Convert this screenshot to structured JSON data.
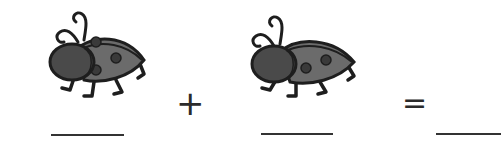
{
  "worksheet": {
    "equation": {
      "term1": {
        "picture": "ladybug-icon",
        "count": 1,
        "answer_blank": ""
      },
      "operator": "+",
      "term2": {
        "picture": "ladybug-icon",
        "count": 1,
        "answer_blank": ""
      },
      "equals": "=",
      "result": {
        "answer_blank": ""
      }
    }
  },
  "colors": {
    "body_dark": "#4a4a4a",
    "shell": "#6b6b6b",
    "outline": "#1e1e1e",
    "blank_line": "#333333"
  }
}
